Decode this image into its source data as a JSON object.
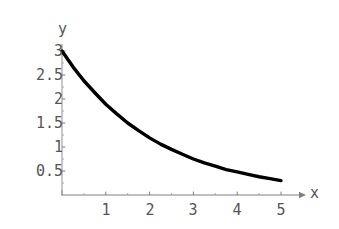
{
  "figure": {
    "background_color": "#ffffff",
    "curve_color": "#000000",
    "axis_color": "#777777",
    "tick_label_color": "#555555",
    "width": 339,
    "height": 229
  },
  "chart_data": {
    "type": "line",
    "title": "",
    "xlabel": "x",
    "ylabel": "y",
    "grid": false,
    "legend": null,
    "xlim": [
      0,
      5
    ],
    "ylim": [
      0,
      3
    ],
    "xticks": [
      1,
      2,
      3,
      4,
      5
    ],
    "xtick_labels": [
      "1",
      "2",
      "3",
      "4",
      "5"
    ],
    "yticks": [
      0.5,
      1,
      1.5,
      2,
      2.5,
      3
    ],
    "ytick_labels": [
      "0.5",
      "1",
      "1.5",
      "2",
      "2.5",
      "3"
    ],
    "series": [
      {
        "name": "y = 3 e^(-0.46 x)",
        "x": [
          0,
          0.25,
          0.5,
          0.75,
          1,
          1.25,
          1.5,
          1.75,
          2,
          2.25,
          2.5,
          2.75,
          3,
          3.25,
          3.5,
          3.75,
          4,
          4.25,
          4.5,
          4.75,
          5
        ],
        "values": [
          3.0,
          2.67,
          2.38,
          2.13,
          1.89,
          1.69,
          1.5,
          1.34,
          1.19,
          1.06,
          0.95,
          0.85,
          0.75,
          0.67,
          0.6,
          0.53,
          0.48,
          0.43,
          0.38,
          0.34,
          0.3
        ]
      }
    ]
  },
  "axes": {
    "y_axis_label": "y",
    "x_axis_label": "x"
  }
}
